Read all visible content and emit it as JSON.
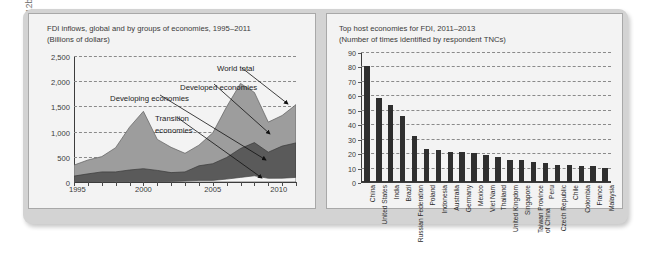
{
  "source_note": "Source: World Investment Report, 2011, 2012b.",
  "left_chart": {
    "title_line1": "FDI inflows, global and by groups of economies, 1995–2011",
    "title_line2": "(Billions of dollars)",
    "series_labels": {
      "world_total": "World total",
      "developed": "Developed economies",
      "developing": "Developing economies",
      "transition_l1": "Transition",
      "transition_l2": "economies"
    }
  },
  "right_chart": {
    "title_line1": "Top host economies for FDI, 2011–2013",
    "title_line2": "(Number of times identified by respondent TNCs)"
  },
  "chart_data": [
    {
      "type": "area",
      "title": "FDI inflows, global and by groups of economies, 1995–2011",
      "subtitle": "(Billions of dollars)",
      "xlabel": "",
      "ylabel": "Billions of dollars",
      "ylim": [
        0,
        2500
      ],
      "yticks": [
        "0",
        "500",
        "1,000",
        "1,500",
        "2,000",
        "2,500"
      ],
      "ytick_values": [
        0,
        500,
        1000,
        1500,
        2000,
        2500
      ],
      "xticks": [
        "1995",
        "2000",
        "2005",
        "2010"
      ],
      "xtick_values": [
        1995,
        2000,
        2005,
        2010
      ],
      "grid": true,
      "stacked": true,
      "x": [
        1995,
        1996,
        1997,
        1998,
        1999,
        2000,
        2001,
        2002,
        2003,
        2004,
        2005,
        2006,
        2007,
        2008,
        2009,
        2010,
        2011
      ],
      "series": [
        {
          "name": "Transition economies",
          "color": "#f2f2f2",
          "values": [
            4,
            6,
            10,
            8,
            9,
            7,
            10,
            12,
            20,
            31,
            31,
            58,
            92,
            123,
            73,
            75,
            92
          ]
        },
        {
          "name": "Developing economies",
          "color": "#585858",
          "values": [
            113,
            152,
            191,
            191,
            229,
            256,
            220,
            174,
            180,
            290,
            332,
            427,
            573,
            658,
            519,
            637,
            684
          ]
        },
        {
          "name": "Developed economies",
          "color": "#9a9a9a",
          "values": [
            222,
            262,
            299,
            483,
            844,
            1138,
            601,
            490,
            366,
            414,
            619,
            1021,
            1310,
            1019,
            606,
            619,
            748
          ]
        }
      ],
      "annotations": [
        "World total",
        "Developed economies",
        "Developing economies",
        "Transition economies"
      ]
    },
    {
      "type": "bar",
      "title": "Top host economies for FDI, 2011–2013",
      "subtitle": "(Number of times identified by respondent TNCs)",
      "xlabel": "",
      "ylabel": "Number of times identified by respondent TNCs",
      "ylim": [
        0,
        90
      ],
      "yticks": [
        "0",
        "10",
        "20",
        "30",
        "40",
        "50",
        "60",
        "70",
        "80",
        "90"
      ],
      "ytick_values": [
        0,
        10,
        20,
        30,
        40,
        50,
        60,
        70,
        80,
        90
      ],
      "grid": true,
      "bar_color": "#2f2f2f",
      "categories": [
        "China",
        "United States",
        "India",
        "Brazil",
        "Russian Federation",
        "Poland",
        "Indonesia",
        "Australia",
        "Germany",
        "Mexico",
        "Viet Nam",
        "Thailand",
        "United Kingdom",
        "Singapore",
        "Taiwan Province of China",
        "Peru",
        "Czech Republic",
        "Chile",
        "Colombia",
        "France",
        "Malaysia"
      ],
      "values": [
        80,
        58,
        53,
        46,
        32,
        23,
        22,
        21,
        21,
        20,
        19,
        17,
        15,
        15,
        14,
        13,
        12,
        12,
        11,
        11,
        10
      ]
    }
  ]
}
